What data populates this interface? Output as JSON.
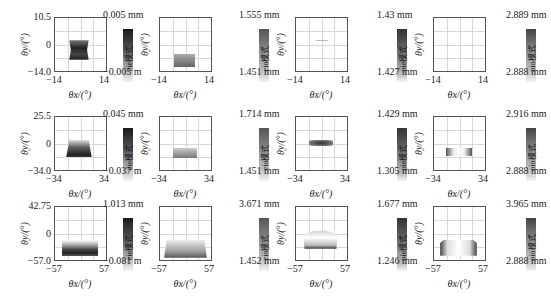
{
  "chart_data": {
    "type": "heatmap",
    "layout": {
      "rows": 3,
      "cols": 4,
      "grid": true
    },
    "xlabel": "θx/(°)",
    "ylabel": "θy/(°)",
    "rows": [
      {
        "xlim": [
          -14,
          14
        ],
        "x_ticks": [
          "-14",
          "14"
        ],
        "y_ticks": [
          "10.5",
          "0",
          "-14.0"
        ],
        "panels": [
          {
            "colorbar_max": "0.005 mm",
            "colorbar_min": "-0.005 m",
            "colorbar_text": "eie模式"
          },
          {
            "colorbar_max": "1.555 mm",
            "colorbar_min": "1.451 mm",
            "colorbar_text": "eio模式"
          },
          {
            "colorbar_max": "1.43 mm",
            "colorbar_min": "1.427 mm",
            "colorbar_text": "oie模式"
          },
          {
            "colorbar_max": "2.889 mm",
            "colorbar_min": "2.888 mm",
            "colorbar_text": "oio模式"
          }
        ]
      },
      {
        "xlim": [
          -34,
          34
        ],
        "x_ticks": [
          "-34",
          "34"
        ],
        "y_ticks": [
          "25.5",
          "0",
          "-34.0"
        ],
        "panels": [
          {
            "colorbar_max": "0.045 mm",
            "colorbar_min": "-0.037 m",
            "colorbar_text": "eie模式"
          },
          {
            "colorbar_max": "1.714 mm",
            "colorbar_min": "1.451 mm",
            "colorbar_text": "eio模式"
          },
          {
            "colorbar_max": "1.429 mm",
            "colorbar_min": "1.305 mm",
            "colorbar_text": "oie模式"
          },
          {
            "colorbar_max": "2.916 mm",
            "colorbar_min": "2.888 mm",
            "colorbar_text": "oio模式"
          }
        ]
      },
      {
        "xlim": [
          -57,
          57
        ],
        "x_ticks": [
          "-57",
          "57"
        ],
        "y_ticks": [
          "42.75",
          "0",
          "-57.0"
        ],
        "panels": [
          {
            "colorbar_max": "1.013 mm",
            "colorbar_min": "-0.081 m",
            "colorbar_text": "eie模式"
          },
          {
            "colorbar_max": "3.671 mm",
            "colorbar_min": "1.452 mm",
            "colorbar_text": "eio模式"
          },
          {
            "colorbar_max": "1.677 mm",
            "colorbar_min": "1.246 mm",
            "colorbar_text": "oie模式"
          },
          {
            "colorbar_max": "3.965 mm",
            "colorbar_min": "2.888 mm",
            "colorbar_text": "oio模式"
          }
        ]
      }
    ]
  },
  "axis": {
    "xlabel": "θx/(°)",
    "ylabel": "θy/(°)"
  },
  "rows": [
    {
      "x_min": "−14",
      "x_max": "14",
      "y_max": "10.5",
      "y_zero": "0",
      "y_min": "−14.0",
      "cb": [
        {
          "max": "0.005 mm",
          "min": "−0.005 m",
          "text": "eie模式"
        },
        {
          "max": "1.555 mm",
          "min": "1.451 mm",
          "text": "eio模式"
        },
        {
          "max": "1.43 mm",
          "min": "1.427 mm",
          "text": "oie模式"
        },
        {
          "max": "2.889 mm",
          "min": "2.888 mm",
          "text": "oio模式"
        }
      ]
    },
    {
      "x_min": "−34",
      "x_max": "34",
      "y_max": "25.5",
      "y_zero": "0",
      "y_min": "−34.0",
      "cb": [
        {
          "max": "0.045 mm",
          "min": "−0.037 m",
          "text": "eie模式"
        },
        {
          "max": "1.714 mm",
          "min": "1.451 mm",
          "text": "eio模式"
        },
        {
          "max": "1.429 mm",
          "min": "1.305 mm",
          "text": "oie模式"
        },
        {
          "max": "2.916 mm",
          "min": "2.888 mm",
          "text": "oio模式"
        }
      ]
    },
    {
      "x_min": "−57",
      "x_max": "57",
      "y_max": "42.75",
      "y_zero": "0",
      "y_min": "−57.0",
      "cb": [
        {
          "max": "1.013 mm",
          "min": "−0.081 m",
          "text": "eie模式"
        },
        {
          "max": "3.671 mm",
          "min": "1.452 mm",
          "text": "eio模式"
        },
        {
          "max": "1.677 mm",
          "min": "1.246 mm",
          "text": "oie模式"
        },
        {
          "max": "3.965 mm",
          "min": "2.888 mm",
          "text": "oio模式"
        }
      ]
    }
  ]
}
